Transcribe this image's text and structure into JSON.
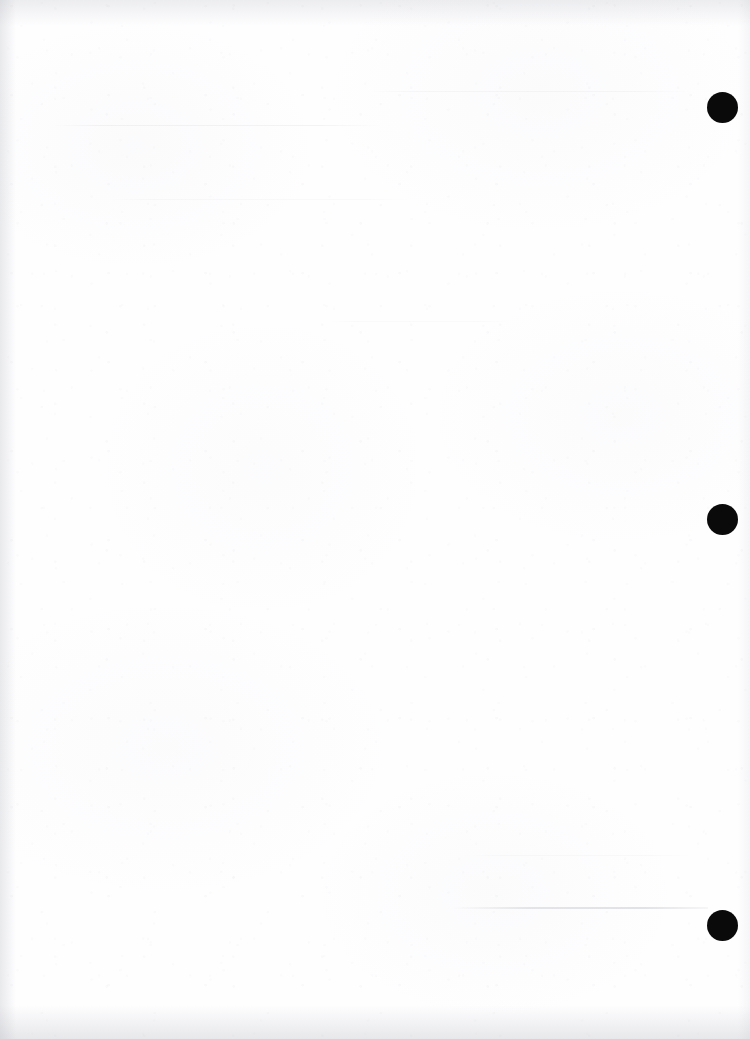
{
  "page": {
    "kind": "scanned-blank-page",
    "width": 750,
    "height": 1039,
    "background_color": "#fefeff",
    "has_visible_text": false,
    "body_text": "",
    "note_text": ""
  },
  "marks": {
    "label": "registration-marks",
    "color": "#0a0a0a",
    "count": 3,
    "diameter": 31,
    "items": [
      {
        "name": "registration-mark-top",
        "cx": 722,
        "cy": 107,
        "d": 31
      },
      {
        "name": "registration-mark-middle",
        "cx": 722,
        "cy": 519,
        "d": 31
      },
      {
        "name": "registration-mark-bottom",
        "cx": 722,
        "cy": 925,
        "d": 31
      }
    ]
  },
  "artifacts": {
    "streak": {
      "name": "scan-streak",
      "x": 452,
      "y": 907,
      "width": 256,
      "height": 2
    },
    "showthrough_regions": [
      {
        "name": "showthrough-top-left",
        "x": 52,
        "y": 122,
        "width": 330,
        "height": 26
      },
      {
        "name": "showthrough-top-middle",
        "x": 370,
        "y": 88,
        "width": 320,
        "height": 52
      },
      {
        "name": "showthrough-upper",
        "x": 110,
        "y": 196,
        "width": 300,
        "height": 18
      },
      {
        "name": "showthrough-middle",
        "x": 330,
        "y": 318,
        "width": 180,
        "height": 14
      },
      {
        "name": "showthrough-lower",
        "x": 470,
        "y": 852,
        "width": 220,
        "height": 14
      }
    ],
    "edge_shading": [
      "top",
      "bottom",
      "left",
      "right"
    ]
  }
}
